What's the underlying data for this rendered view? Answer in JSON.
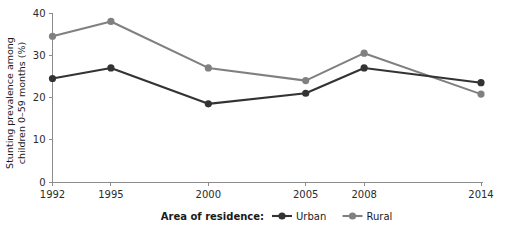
{
  "chart_data": {
    "type": "line",
    "title": "",
    "xlabel": "",
    "ylabel": "Stunting prevalence among children 0–59 months (%)",
    "ylabel_line1": "Stunting prevalence among",
    "ylabel_line2": "children 0–59 months (%)",
    "categories": [
      "1992",
      "1995",
      "2000",
      "2005",
      "2008",
      "2014"
    ],
    "x": [
      1992,
      1995,
      2000,
      2005,
      2008,
      2014
    ],
    "xlim": [
      1992,
      2014
    ],
    "ylim": [
      0,
      40
    ],
    "yticks": [
      0,
      10,
      20,
      30,
      40
    ],
    "ytick_labels": [
      "0",
      "10",
      "20",
      "30",
      "40"
    ],
    "xtick_labels": [
      "1992",
      "1995",
      "2000",
      "2005",
      "2008",
      "2014"
    ],
    "grid": false,
    "legend_position": "bottom",
    "legend_title": "Area of residence:",
    "series": [
      {
        "name": "Urban",
        "color": "#333333",
        "values": [
          24.5,
          27.0,
          18.5,
          21.0,
          27.0,
          23.5
        ]
      },
      {
        "name": "Rural",
        "color": "#808080",
        "values": [
          34.5,
          38.0,
          27.0,
          24.0,
          30.5,
          20.8
        ]
      }
    ]
  },
  "style": {
    "background": "#ffffff",
    "axis_color": "#8c8c8c",
    "text_color": "#1a1a1a",
    "urban_color": "#333333",
    "rural_color": "#808080"
  }
}
